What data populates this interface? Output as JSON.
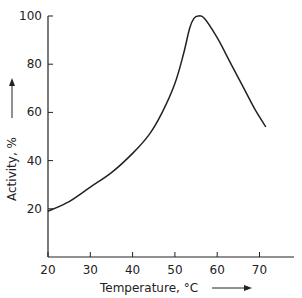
{
  "chart_data": {
    "type": "line",
    "title": "",
    "xlabel": "Temperature, °C",
    "ylabel": "Activity, %",
    "xlim": [
      20,
      78
    ],
    "ylim": [
      0,
      100
    ],
    "x_ticks": [
      20,
      30,
      40,
      50,
      60,
      70
    ],
    "y_ticks": [
      20,
      40,
      60,
      80,
      100
    ],
    "grid": false,
    "legend": null,
    "series": [
      {
        "name": "Activity",
        "x": [
          20,
          25,
          30,
          35,
          40,
          44,
          47,
          50,
          52,
          53.5,
          54.5,
          55.5,
          57,
          60,
          63,
          66,
          69,
          71.5
        ],
        "y": [
          19,
          23,
          29,
          35,
          43,
          51,
          60,
          72,
          84,
          95,
          99,
          100,
          99,
          91,
          81,
          71,
          61,
          54
        ]
      }
    ]
  }
}
